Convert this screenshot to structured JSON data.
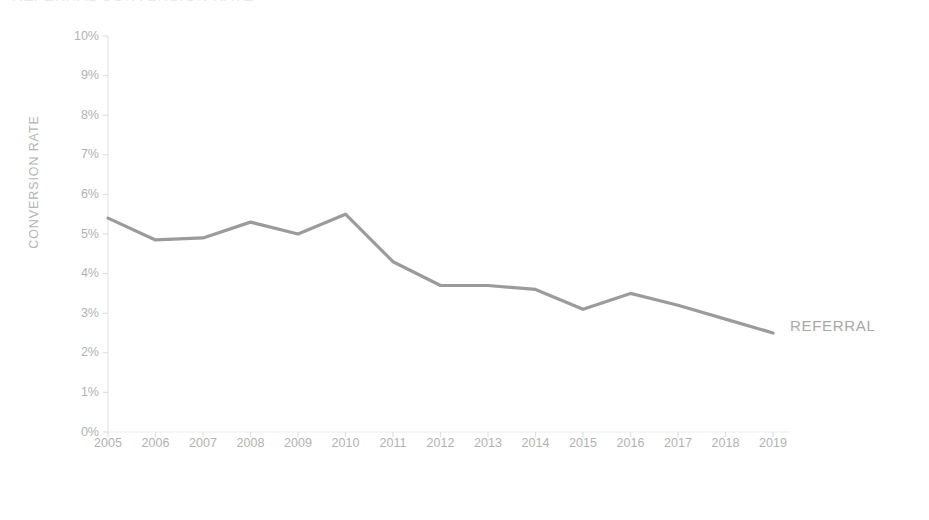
{
  "chart_data": {
    "type": "line",
    "title": "REFERRAL CONVERSION RATE",
    "xlabel": "FISCAL YEAR",
    "ylabel": "CONVERSION RATE",
    "categories": [
      "2005",
      "2006",
      "2007",
      "2008",
      "2009",
      "2010",
      "2011",
      "2012",
      "2013",
      "2014",
      "2015",
      "2016",
      "2017",
      "2018",
      "2019"
    ],
    "series": [
      {
        "name": "REFERRAL",
        "color": "#9b9b9b",
        "values": [
          5.4,
          4.85,
          4.9,
          5.3,
          5.0,
          5.5,
          4.3,
          3.7,
          3.7,
          3.6,
          3.1,
          3.5,
          3.2,
          2.85,
          2.5
        ]
      }
    ],
    "ytick_labels": [
      "10%",
      "9%",
      "8%",
      "7%",
      "6%",
      "5%",
      "4%",
      "3%",
      "2%",
      "1%",
      "0%"
    ],
    "ytick_values": [
      10,
      9,
      8,
      7,
      6,
      5,
      4,
      3,
      2,
      1,
      0
    ],
    "ylim": [
      0,
      10
    ],
    "grid": false,
    "legend_position": "end-of-line",
    "axis_color": "#e4e4e4",
    "tick_color": "#e0e0e0",
    "label_color": "#b2b2b2",
    "background": "#ffffff"
  },
  "labels": {
    "series_end_label": "REFERRAL"
  }
}
